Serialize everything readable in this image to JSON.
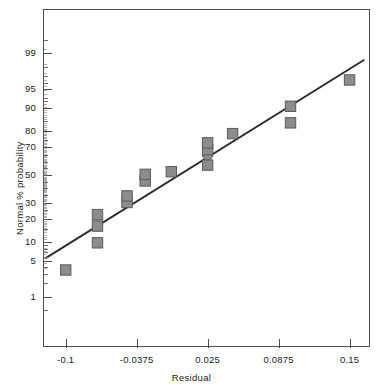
{
  "chart_data": {
    "type": "scatter",
    "title": "",
    "subtitle": "",
    "xlabel": "Residual",
    "ylabel": "Normal % probability",
    "xlim": [
      -0.12,
      0.168
    ],
    "ylim_percent": [
      0.2,
      99.9
    ],
    "yscale": "normal-probability",
    "grid": false,
    "legend": false,
    "xticks": [
      -0.1,
      -0.0375,
      0.025,
      0.0875,
      0.15
    ],
    "xticklabels": [
      "-0.1",
      "-0.0375",
      "0.025",
      "0.0875",
      "0.15"
    ],
    "yticks": [
      1,
      5,
      10,
      20,
      30,
      50,
      70,
      80,
      90,
      95,
      99
    ],
    "yticklabels": [
      "1",
      "5",
      "10",
      "20",
      "30",
      "50",
      "70",
      "80",
      "90",
      "95",
      "99"
    ],
    "y_minor_ticks": [
      0.5,
      2,
      3,
      4,
      6,
      7,
      8,
      9,
      15,
      25,
      35,
      40,
      45,
      55,
      60,
      65,
      75,
      85,
      92,
      93,
      96,
      97,
      98,
      99.5
    ],
    "series": [
      {
        "name": "residual points",
        "marker": "square",
        "color": "#8c8c8c",
        "edge_color": "#5a5a5a",
        "points": [
          {
            "x": -0.1,
            "y": 3.5,
            "marker": "square"
          },
          {
            "x": -0.072,
            "y": 9.8,
            "marker": "square"
          },
          {
            "x": -0.072,
            "y": 16.5,
            "marker": "square"
          },
          {
            "x": -0.072,
            "y": 22.5,
            "marker": "square"
          },
          {
            "x": -0.046,
            "y": 30.0,
            "marker": "square"
          },
          {
            "x": -0.046,
            "y": 34.5,
            "marker": "square"
          },
          {
            "x": -0.03,
            "y": 45.5,
            "marker": "square"
          },
          {
            "x": -0.03,
            "y": 50.5,
            "marker": "square"
          },
          {
            "x": -0.007,
            "y": 52.5,
            "marker": "square"
          },
          {
            "x": 0.025,
            "y": 57.5,
            "marker": "square"
          },
          {
            "x": 0.025,
            "y": 65.0,
            "marker": "circle"
          },
          {
            "x": 0.025,
            "y": 68.5,
            "marker": "square"
          },
          {
            "x": 0.025,
            "y": 73.0,
            "marker": "square"
          },
          {
            "x": 0.047,
            "y": 78.5,
            "marker": "square"
          },
          {
            "x": 0.098,
            "y": 84.0,
            "marker": "square"
          },
          {
            "x": 0.098,
            "y": 90.5,
            "marker": "square"
          },
          {
            "x": 0.15,
            "y": 96.5,
            "marker": "square"
          }
        ]
      }
    ],
    "reference_line": {
      "name": "normal reference line",
      "color": "#2b2b2b",
      "x_start": -0.118,
      "y_start_percent": 5.6,
      "x_end": 0.163,
      "y_end_percent": 98.6
    }
  },
  "axes": {
    "x_title": "Residual",
    "y_title": "Normal % probability"
  }
}
